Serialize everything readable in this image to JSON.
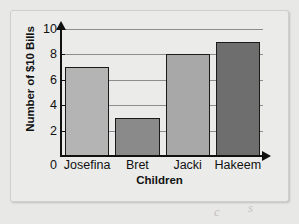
{
  "chart_data": {
    "type": "bar",
    "title": "",
    "xlabel": "Children",
    "ylabel": "Number of $10 Bills",
    "categories": [
      "Josefina",
      "Bret",
      "Jacki",
      "Hakeem"
    ],
    "values": [
      7,
      3,
      8,
      9
    ],
    "ylim": [
      0,
      10
    ],
    "yticks": [
      0,
      2,
      4,
      6,
      8,
      10
    ],
    "ytick_labels": [
      "0",
      "2",
      "4",
      "6",
      "8",
      "10"
    ],
    "grid": true,
    "legend": false,
    "bar_colors": [
      "#b4b4b4",
      "#8a8a8a",
      "#a8a8a8",
      "#6e6e6e"
    ],
    "bar_edge_color": "#1a1a1a",
    "axis_color": "#111111",
    "gridline_color": "#8d8d8d"
  },
  "page": {
    "background": "#e8e8e6",
    "panel_background": "#ebebe9",
    "scribbles": [
      "c",
      "s"
    ]
  }
}
